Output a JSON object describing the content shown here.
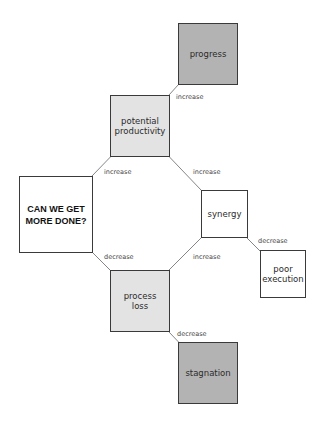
{
  "nodes": {
    "root": {
      "label": "CAN WE GET MORE DONE?",
      "line1": "CAN WE GET",
      "line2": "MORE DONE?"
    },
    "potential_productivity": {
      "line1": "potential",
      "line2": "productivity"
    },
    "progress": {
      "label": "progress"
    },
    "synergy": {
      "label": "synergy"
    },
    "poor_execution": {
      "line1": "poor",
      "line2": "execution"
    },
    "process_loss": {
      "line1": "process",
      "line2": "loss"
    },
    "stagnation": {
      "label": "stagnation"
    }
  },
  "edges": [
    {
      "from": "root",
      "to": "potential productivity",
      "label": "increase"
    },
    {
      "from": "potential productivity",
      "to": "progress",
      "label": "increase"
    },
    {
      "from": "synergy",
      "to": "potential productivity",
      "label": "increase"
    },
    {
      "from": "process loss",
      "to": "synergy",
      "label": "increase"
    },
    {
      "from": "synergy",
      "to": "poor execution",
      "label": "decrease"
    },
    {
      "from": "root",
      "to": "process loss",
      "label": "decrease"
    },
    {
      "from": "process loss",
      "to": "stagnation",
      "label": "decrease"
    }
  ],
  "colors": {
    "dark_fill": "#b3b3b3",
    "light_fill": "#e3e3e3",
    "border": "#3a3a3a"
  }
}
